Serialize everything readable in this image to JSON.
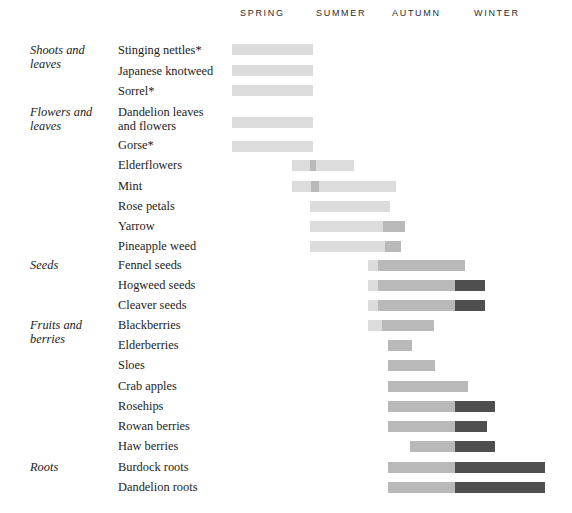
{
  "chart_data": {
    "type": "bar",
    "title": "",
    "subtitle": "",
    "xlabel": "",
    "ylabel": "",
    "grid": false,
    "legend_position": "none",
    "orientation": "horizontal",
    "axis": {
      "type": "seasonal-timeline",
      "ticks": [
        "SPRING",
        "SUMMER",
        "AUTUMN",
        "WINTER"
      ],
      "tick_x": [
        240,
        316,
        392,
        474
      ],
      "range_px": [
        232,
        548
      ]
    },
    "colors": {
      "bar_light": "#dcdcdc",
      "bar_mid": "#b9b9b9",
      "bar_dark": "#4f4f4f",
      "text": "#1c1c1c",
      "header_text": "#2b2b2b",
      "background": "#ffffff"
    },
    "categories": [
      "Shoots and leaves",
      "Flowers and leaves",
      "Seeds",
      "Fruits and berries",
      "Roots"
    ],
    "series": [
      {
        "name": "Stinging nettles*",
        "category": "Shoots and leaves",
        "category_line1": "Shoots and",
        "category_line2": "leaves",
        "label_line1": "Stinging nettles*",
        "label_line2": "",
        "y": 44,
        "label_y": 44,
        "segments": [
          {
            "x": 232,
            "w": 81,
            "tone": "light"
          }
        ]
      },
      {
        "name": "Japanese knotweed",
        "category": "",
        "category_line1": "",
        "category_line2": "",
        "label_line1": "Japanese knotweed",
        "label_line2": "",
        "y": 65,
        "label_y": 65,
        "segments": [
          {
            "x": 232,
            "w": 81,
            "tone": "light"
          }
        ]
      },
      {
        "name": "Sorrel*",
        "category": "",
        "category_line1": "",
        "category_line2": "",
        "label_line1": "Sorrel*",
        "label_line2": "",
        "y": 85,
        "label_y": 85,
        "segments": [
          {
            "x": 232,
            "w": 81,
            "tone": "light"
          }
        ]
      },
      {
        "name": "Dandelion leaves and flowers",
        "category": "Flowers and leaves",
        "category_line1": "Flowers and",
        "category_line2": "leaves",
        "label_line1": "Dandelion leaves",
        "label_line2": "and flowers",
        "y": 117,
        "label_y": 106,
        "segments": [
          {
            "x": 232,
            "w": 81,
            "tone": "light"
          }
        ]
      },
      {
        "name": "Gorse*",
        "category": "",
        "category_line1": "",
        "category_line2": "",
        "label_line1": "Gorse*",
        "label_line2": "",
        "y": 141,
        "label_y": 139,
        "segments": [
          {
            "x": 232,
            "w": 81,
            "tone": "light"
          }
        ]
      },
      {
        "name": "Elderflowers",
        "category": "",
        "category_line1": "",
        "category_line2": "",
        "label_line1": "Elderflowers",
        "label_line2": "",
        "y": 160,
        "label_y": 159,
        "segments": [
          {
            "x": 292,
            "w": 18,
            "tone": "light"
          },
          {
            "x": 310,
            "w": 6,
            "tone": "mid"
          },
          {
            "x": 316,
            "w": 38,
            "tone": "light"
          }
        ]
      },
      {
        "name": "Mint",
        "category": "",
        "category_line1": "",
        "category_line2": "",
        "label_line1": "Mint",
        "label_line2": "",
        "y": 181,
        "label_y": 180,
        "segments": [
          {
            "x": 292,
            "w": 19,
            "tone": "light"
          },
          {
            "x": 311,
            "w": 8,
            "tone": "mid"
          },
          {
            "x": 319,
            "w": 77,
            "tone": "light"
          }
        ]
      },
      {
        "name": "Rose petals",
        "category": "",
        "category_line1": "",
        "category_line2": "",
        "label_line1": "Rose petals",
        "label_line2": "",
        "y": 201,
        "label_y": 200,
        "segments": [
          {
            "x": 310,
            "w": 80,
            "tone": "light"
          }
        ]
      },
      {
        "name": "Yarrow",
        "category": "",
        "category_line1": "",
        "category_line2": "",
        "label_line1": "Yarrow",
        "label_line2": "",
        "y": 221,
        "label_y": 220,
        "segments": [
          {
            "x": 310,
            "w": 73,
            "tone": "light"
          },
          {
            "x": 383,
            "w": 22,
            "tone": "mid"
          }
        ]
      },
      {
        "name": "Pineapple weed",
        "category": "",
        "category_line1": "",
        "category_line2": "",
        "label_line1": "Pineapple weed",
        "label_line2": "",
        "y": 241,
        "label_y": 240,
        "segments": [
          {
            "x": 310,
            "w": 75,
            "tone": "light"
          },
          {
            "x": 385,
            "w": 16,
            "tone": "mid"
          }
        ]
      },
      {
        "name": "Fennel seeds",
        "category": "Seeds",
        "category_line1": "Seeds",
        "category_line2": "",
        "label_line1": "Fennel seeds",
        "label_line2": "",
        "y": 260,
        "label_y": 259,
        "segments": [
          {
            "x": 368,
            "w": 10,
            "tone": "light"
          },
          {
            "x": 378,
            "w": 87,
            "tone": "mid"
          }
        ]
      },
      {
        "name": "Hogweed seeds",
        "category": "",
        "category_line1": "",
        "category_line2": "",
        "label_line1": "Hogweed seeds",
        "label_line2": "",
        "y": 280,
        "label_y": 279,
        "segments": [
          {
            "x": 368,
            "w": 10,
            "tone": "light"
          },
          {
            "x": 378,
            "w": 77,
            "tone": "mid"
          },
          {
            "x": 455,
            "w": 30,
            "tone": "dark"
          }
        ]
      },
      {
        "name": "Cleaver seeds",
        "category": "",
        "category_line1": "",
        "category_line2": "",
        "label_line1": "Cleaver seeds",
        "label_line2": "",
        "y": 300,
        "label_y": 299,
        "segments": [
          {
            "x": 368,
            "w": 10,
            "tone": "light"
          },
          {
            "x": 378,
            "w": 77,
            "tone": "mid"
          },
          {
            "x": 455,
            "w": 30,
            "tone": "dark"
          }
        ]
      },
      {
        "name": "Blackberries",
        "category": "Fruits and berries",
        "category_line1": "Fruits and",
        "category_line2": "berries",
        "label_line1": "Blackberries",
        "label_line2": "",
        "y": 320,
        "label_y": 319,
        "segments": [
          {
            "x": 368,
            "w": 14,
            "tone": "light"
          },
          {
            "x": 382,
            "w": 52,
            "tone": "mid"
          }
        ]
      },
      {
        "name": "Elderberries",
        "category": "",
        "category_line1": "",
        "category_line2": "",
        "label_line1": "Elderberries",
        "label_line2": "",
        "y": 340,
        "label_y": 339,
        "segments": [
          {
            "x": 388,
            "w": 24,
            "tone": "mid"
          }
        ]
      },
      {
        "name": "Sloes",
        "category": "",
        "category_line1": "",
        "category_line2": "",
        "label_line1": "Sloes",
        "label_line2": "",
        "y": 360,
        "label_y": 359,
        "segments": [
          {
            "x": 388,
            "w": 47,
            "tone": "mid"
          }
        ]
      },
      {
        "name": "Crab apples",
        "category": "",
        "category_line1": "",
        "category_line2": "",
        "label_line1": "Crab apples",
        "label_line2": "",
        "y": 381,
        "label_y": 380,
        "segments": [
          {
            "x": 388,
            "w": 80,
            "tone": "mid"
          }
        ]
      },
      {
        "name": "Rosehips",
        "category": "",
        "category_line1": "",
        "category_line2": "",
        "label_line1": "Rosehips",
        "label_line2": "",
        "y": 401,
        "label_y": 400,
        "segments": [
          {
            "x": 388,
            "w": 67,
            "tone": "mid"
          },
          {
            "x": 455,
            "w": 40,
            "tone": "dark"
          }
        ]
      },
      {
        "name": "Rowan berries",
        "category": "",
        "category_line1": "",
        "category_line2": "",
        "label_line1": "Rowan berries",
        "label_line2": "",
        "y": 421,
        "label_y": 420,
        "segments": [
          {
            "x": 388,
            "w": 67,
            "tone": "mid"
          },
          {
            "x": 455,
            "w": 32,
            "tone": "dark"
          }
        ]
      },
      {
        "name": "Haw berries",
        "category": "",
        "category_line1": "",
        "category_line2": "",
        "label_line1": "Haw berries",
        "label_line2": "",
        "y": 441,
        "label_y": 440,
        "segments": [
          {
            "x": 410,
            "w": 45,
            "tone": "mid"
          },
          {
            "x": 455,
            "w": 40,
            "tone": "dark"
          }
        ]
      },
      {
        "name": "Burdock roots",
        "category": "Roots",
        "category_line1": "Roots",
        "category_line2": "",
        "label_line1": "Burdock roots",
        "label_line2": "",
        "y": 462,
        "label_y": 461,
        "segments": [
          {
            "x": 388,
            "w": 67,
            "tone": "mid"
          },
          {
            "x": 455,
            "w": 90,
            "tone": "dark"
          }
        ]
      },
      {
        "name": "Dandelion roots",
        "category": "",
        "category_line1": "",
        "category_line2": "",
        "label_line1": "Dandelion roots",
        "label_line2": "",
        "y": 482,
        "label_y": 481,
        "segments": [
          {
            "x": 388,
            "w": 67,
            "tone": "mid"
          },
          {
            "x": 455,
            "w": 90,
            "tone": "dark"
          }
        ]
      }
    ]
  }
}
